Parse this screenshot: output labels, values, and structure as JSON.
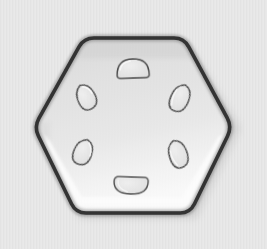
{
  "image": {
    "subject": "hexagonal plate with six hole impressions",
    "width": 267,
    "height": 249,
    "background_color": "#e9e9e9",
    "background_texture": "fine vertical striping",
    "lighting": "soft top-left, bright specular band along lower inner edge"
  },
  "palette": {
    "background": "#e9e9e9",
    "background_shadow": "#d9d9d9",
    "plate_fill_top": "#dcdcdc",
    "plate_fill_mid": "#e4e4e4",
    "plate_fill_bottom": "#f3f3f3",
    "plate_outline": "#151515",
    "plate_outline_soft": "#4a4a4a",
    "highlight": "#fdfdfd",
    "hole_outline": "#3a3a3a",
    "hole_fill": "#e6e6e6",
    "drop_shadow": "#bdbdbd"
  },
  "hexagon": {
    "label": "hexagonal plate",
    "center": {
      "x": 133,
      "y": 126
    },
    "vertices": [
      {
        "name": "top-left",
        "x": 84,
        "y": 38
      },
      {
        "name": "top-right",
        "x": 184,
        "y": 38
      },
      {
        "name": "right",
        "x": 232,
        "y": 127
      },
      {
        "name": "bottom-right",
        "x": 190,
        "y": 213
      },
      {
        "name": "bottom-left",
        "x": 76,
        "y": 213
      },
      {
        "name": "left",
        "x": 34,
        "y": 127
      }
    ],
    "corner_radius": 10,
    "outline_width": 4
  },
  "holes": [
    {
      "id": "hole-top",
      "label": "top D-shape",
      "cx": 133,
      "cy": 69,
      "rx": 16,
      "ry": 10,
      "rotation": -2,
      "shape": "d-flat-bottom"
    },
    {
      "id": "hole-upper-left",
      "label": "upper-left teardrop",
      "cx": 86,
      "cy": 97,
      "rx": 9,
      "ry": 13,
      "rotation": -28,
      "shape": "teardrop"
    },
    {
      "id": "hole-upper-right",
      "label": "upper-right oval",
      "cx": 180,
      "cy": 98,
      "rx": 9,
      "ry": 14,
      "rotation": 22,
      "shape": "oval"
    },
    {
      "id": "hole-lower-left",
      "label": "lower-left oval",
      "cx": 83,
      "cy": 152,
      "rx": 9,
      "ry": 13,
      "rotation": 20,
      "shape": "oval"
    },
    {
      "id": "hole-lower-right",
      "label": "lower-right oval",
      "cx": 178,
      "cy": 154,
      "rx": 9,
      "ry": 14,
      "rotation": -20,
      "shape": "oval"
    },
    {
      "id": "hole-bottom",
      "label": "bottom D-shape",
      "cx": 131,
      "cy": 186,
      "rx": 17,
      "ry": 9,
      "rotation": 2,
      "shape": "d-flat-bottom-wide"
    }
  ]
}
